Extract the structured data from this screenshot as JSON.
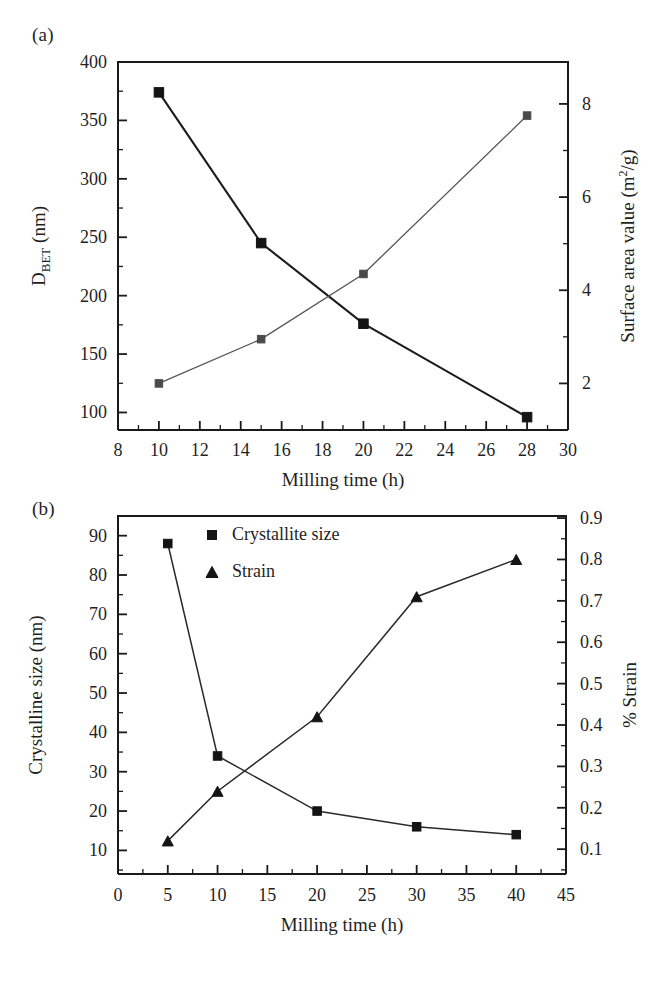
{
  "figure": {
    "panels": [
      {
        "tag": "(a)",
        "xlabel": "Milling time (h)",
        "y_left_label_main": "D",
        "y_left_label_sub": "BET",
        "y_left_label_tail": " (nm)",
        "y_right_label_pre": "Surface area value (m",
        "y_right_label_sup": "2",
        "y_right_label_post": "/g)",
        "x_ticks": [
          "8",
          "10",
          "12",
          "14",
          "16",
          "18",
          "20",
          "22",
          "24",
          "26",
          "28",
          "30"
        ],
        "y_left_ticks": [
          "100",
          "150",
          "200",
          "250",
          "300",
          "350",
          "400"
        ],
        "y_right_ticks": [
          "2",
          "4",
          "6",
          "8"
        ]
      },
      {
        "tag": "(b)",
        "xlabel": "Milling time (h)",
        "y_left_label": "Crystalline size (nm)",
        "y_right_label": "% Strain",
        "x_ticks": [
          "0",
          "5",
          "10",
          "15",
          "20",
          "25",
          "30",
          "35",
          "40",
          "45"
        ],
        "y_left_ticks": [
          "10",
          "20",
          "30",
          "40",
          "50",
          "60",
          "70",
          "80",
          "90"
        ],
        "y_right_ticks": [
          "0.1",
          "0.2",
          "0.3",
          "0.4",
          "0.5",
          "0.6",
          "0.7",
          "0.8",
          "0.9"
        ],
        "legend": [
          {
            "marker": "square",
            "label": "Crystallite size"
          },
          {
            "marker": "triangle",
            "label": "Strain"
          }
        ]
      }
    ],
    "colors": {
      "ink": "#1a1a1a",
      "series_dark": "#141414",
      "series_light": "#4a4a4a"
    }
  },
  "chart_data": [
    {
      "type": "line",
      "panel": "(a)",
      "title": "",
      "xlabel": "Milling time (h)",
      "ylabel": "D_BET (nm)",
      "y2label": "Surface area value (m2/g)",
      "xlim": [
        8,
        30
      ],
      "ylim": [
        85,
        400
      ],
      "y2lim": [
        1.0,
        8.9
      ],
      "xticks": [
        8,
        10,
        12,
        14,
        16,
        18,
        20,
        22,
        24,
        26,
        28,
        30
      ],
      "yticks": [
        100,
        150,
        200,
        250,
        300,
        350,
        400
      ],
      "y2ticks": [
        2,
        4,
        6,
        8
      ],
      "grid": false,
      "legend": "none",
      "series": [
        {
          "name": "D_BET",
          "axis": "left",
          "marker": "square",
          "x": [
            10,
            15,
            20,
            28
          ],
          "values": [
            374,
            245,
            176,
            96
          ]
        },
        {
          "name": "Surface area value",
          "axis": "right",
          "marker": "square",
          "x": [
            10,
            15,
            20,
            28
          ],
          "values": [
            2.0,
            2.95,
            4.35,
            7.75
          ]
        }
      ]
    },
    {
      "type": "line",
      "panel": "(b)",
      "title": "",
      "xlabel": "Milling time (h)",
      "ylabel": "Crystalline size (nm)",
      "y2label": "% Strain",
      "xlim": [
        0,
        45
      ],
      "ylim": [
        4,
        95
      ],
      "y2lim": [
        0.04,
        0.905
      ],
      "xticks": [
        0,
        5,
        10,
        15,
        20,
        25,
        30,
        35,
        40,
        45
      ],
      "yticks": [
        10,
        20,
        30,
        40,
        50,
        60,
        70,
        80,
        90
      ],
      "y2ticks": [
        0.1,
        0.2,
        0.3,
        0.4,
        0.5,
        0.6,
        0.7,
        0.8,
        0.9
      ],
      "grid": false,
      "legend": "upper-left-inside",
      "series": [
        {
          "name": "Crystallite size",
          "axis": "left",
          "marker": "square",
          "x": [
            5,
            10,
            20,
            30,
            40
          ],
          "values": [
            88,
            34,
            20,
            16,
            14
          ]
        },
        {
          "name": "Strain",
          "axis": "right",
          "marker": "triangle",
          "x": [
            5,
            10,
            20,
            30,
            40
          ],
          "values": [
            0.12,
            0.24,
            0.42,
            0.71,
            0.8
          ]
        }
      ]
    }
  ]
}
